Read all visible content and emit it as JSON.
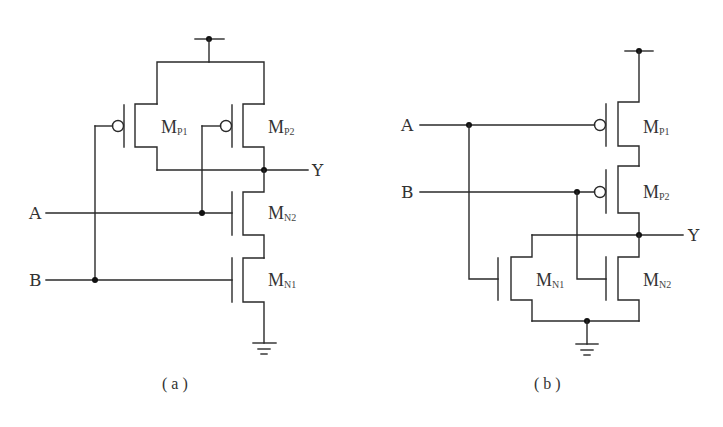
{
  "figure": {
    "panels": [
      {
        "id": "a",
        "caption": "( a )",
        "inputs": [
          "A",
          "B"
        ],
        "output": "Y",
        "transistors": [
          {
            "name": "M",
            "sub": "P1",
            "type": "pmos"
          },
          {
            "name": "M",
            "sub": "P2",
            "type": "pmos"
          },
          {
            "name": "M",
            "sub": "N2",
            "type": "nmos"
          },
          {
            "name": "M",
            "sub": "N1",
            "type": "nmos"
          }
        ],
        "topology": "PMOS parallel, NMOS series (NAND)"
      },
      {
        "id": "b",
        "caption": "( b )",
        "inputs": [
          "A",
          "B"
        ],
        "output": "Y",
        "transistors": [
          {
            "name": "M",
            "sub": "P1",
            "type": "pmos"
          },
          {
            "name": "M",
            "sub": "P2",
            "type": "pmos"
          },
          {
            "name": "M",
            "sub": "N1",
            "type": "nmos"
          },
          {
            "name": "M",
            "sub": "N2",
            "type": "nmos"
          }
        ],
        "topology": "PMOS series, NMOS parallel (NOR)"
      }
    ]
  },
  "colors": {
    "wire": "#2a2a2a",
    "text": "#333333",
    "background": "#ffffff"
  }
}
